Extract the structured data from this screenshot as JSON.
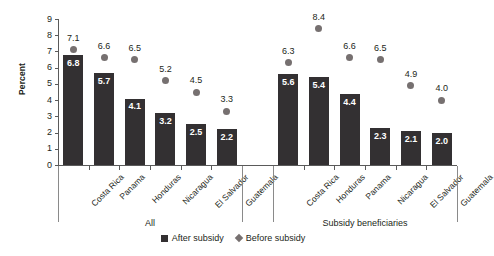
{
  "chart_data": {
    "type": "bar",
    "title": "",
    "xlabel": "",
    "ylabel": "Percent",
    "ylim": [
      0,
      9
    ],
    "ytick_values": [
      9,
      8,
      7,
      6,
      5,
      4,
      3,
      2,
      1,
      0
    ],
    "grid": false,
    "legend_position": "bottom-center",
    "series": [
      {
        "name": "After subsidy",
        "marker": "square",
        "color": "#333032",
        "render": "bar"
      },
      {
        "name": "Before subsidy",
        "marker": "diamond",
        "color": "#767070",
        "render": "point"
      }
    ],
    "groups": [
      {
        "label": "All",
        "categories": [
          "Costa Rica",
          "Panama",
          "Honduras",
          "Nicaragua",
          "El Salvador",
          "Guatemala"
        ],
        "after_subsidy": [
          6.8,
          5.7,
          4.1,
          3.2,
          2.5,
          2.2
        ],
        "before_subsidy": [
          7.1,
          6.6,
          6.5,
          5.2,
          4.5,
          3.3
        ]
      },
      {
        "label": "Subsidy beneficiaries",
        "categories": [
          "Costa Rica",
          "Honduras",
          "Panama",
          "Nicaragua",
          "El Salvador",
          "Guatemala"
        ],
        "after_subsidy": [
          5.6,
          5.4,
          4.4,
          2.3,
          2.1,
          2.0
        ],
        "before_subsidy": [
          6.3,
          8.4,
          6.6,
          6.5,
          4.9,
          4.0
        ]
      }
    ]
  },
  "legend": {
    "items": [
      {
        "label": "After subsidy"
      },
      {
        "label": "Before subsidy"
      }
    ]
  },
  "colors": {
    "bar": "#333032",
    "marker": "#767070",
    "axis": "#5a5a5a",
    "text": "#231f20",
    "background": "#ffffff"
  }
}
